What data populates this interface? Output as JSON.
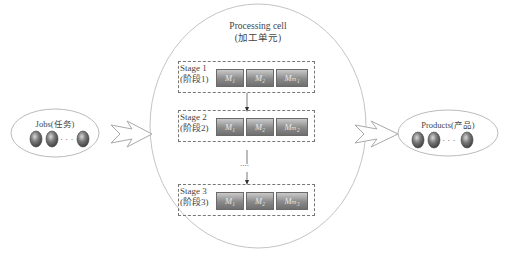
{
  "cell": {
    "title": "Processing cell",
    "subtitle": "(加工单元)"
  },
  "jobs": {
    "label": "Jobs(任务)",
    "ellipsis": "· · ·",
    "count_shown": 3
  },
  "products": {
    "label": "Products(产品)",
    "ellipsis": "· · ·",
    "count_shown": 3
  },
  "stages": [
    {
      "name": "Stage 1",
      "cn": "(阶段1)",
      "machines": [
        "M₁",
        "M₂",
        "Mₘ₁"
      ]
    },
    {
      "name": "Stage 2",
      "cn": "(阶段2)",
      "machines": [
        "M₁",
        "M₂",
        "Mₘ₂"
      ]
    },
    {
      "name": "Stage 3",
      "cn": "(阶段3)",
      "machines": [
        "M₁",
        "M₂",
        "Mₘ₃"
      ]
    }
  ],
  "between_stage_ellipsis": "....",
  "colors": {
    "outline": "#bbbbbb",
    "dashed": "#777777",
    "machine_dark": "#6f6f6f",
    "machine_light": "#c9c9c9"
  }
}
